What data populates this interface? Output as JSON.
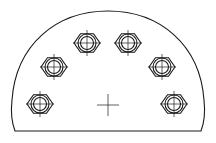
{
  "diagram": {
    "type": "technical-drawing",
    "line_color": "#1a1a1a",
    "background": "#ffffff",
    "plate": {
      "shape": "half-disc with straight bottom edge",
      "bottom_y": 131,
      "left_x": 14,
      "right_x": 202,
      "top_y": 11
    },
    "center_mark": {
      "x": 108,
      "y": 105,
      "size": 11
    },
    "bolts": [
      {
        "id": "bolt-1",
        "x": 40,
        "y": 104
      },
      {
        "id": "bolt-2",
        "x": 54,
        "y": 67
      },
      {
        "id": "bolt-3",
        "x": 87,
        "y": 43
      },
      {
        "id": "bolt-4",
        "x": 128,
        "y": 43
      },
      {
        "id": "bolt-5",
        "x": 162,
        "y": 67
      },
      {
        "id": "bolt-6",
        "x": 174,
        "y": 104
      }
    ],
    "bolt_geometry": {
      "hex_radius": 13,
      "washer_radius": 9,
      "hole_radius": 6.5
    }
  }
}
